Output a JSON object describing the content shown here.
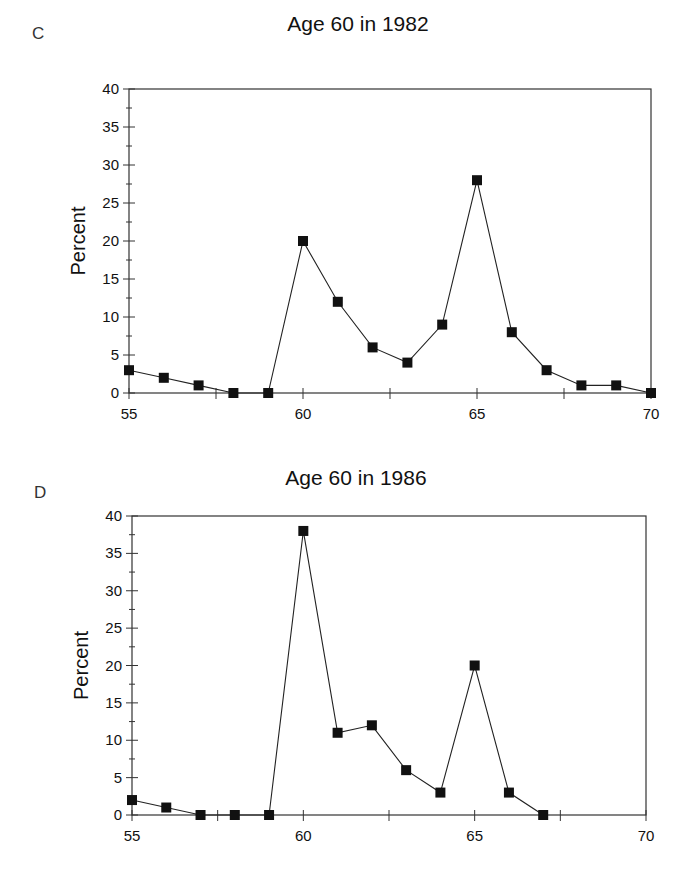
{
  "chart_data": [
    {
      "panel": "C",
      "type": "line",
      "title": "Age 60 in 1982",
      "xlabel": "",
      "ylabel": "Percent",
      "x": [
        55,
        56,
        57,
        58,
        59,
        60,
        61,
        62,
        63,
        64,
        65,
        66,
        67,
        68,
        69,
        70
      ],
      "series": [
        {
          "name": "Age 60 in 1982",
          "values": [
            3,
            2,
            1,
            0,
            0,
            20,
            12,
            6,
            4,
            9,
            28,
            8,
            3,
            1,
            1,
            0
          ]
        }
      ],
      "xlim": [
        55,
        70
      ],
      "ylim": [
        0,
        40
      ],
      "xticks": [
        55,
        60,
        65,
        70
      ],
      "yticks": [
        0,
        5,
        10,
        15,
        20,
        25,
        30,
        35,
        40
      ],
      "marker": "square",
      "grid": false,
      "legend": "none"
    },
    {
      "panel": "D",
      "type": "line",
      "title": "Age 60 in 1986",
      "xlabel": "",
      "ylabel": "Percent",
      "x": [
        55,
        56,
        57,
        58,
        59,
        60,
        61,
        62,
        63,
        64,
        65,
        66,
        67
      ],
      "series": [
        {
          "name": "Age 60 in 1986",
          "values": [
            2,
            1,
            0,
            0,
            0,
            38,
            11,
            12,
            6,
            3,
            20,
            3,
            0
          ]
        }
      ],
      "xlim": [
        55,
        70
      ],
      "ylim": [
        0,
        40
      ],
      "xticks": [
        55,
        60,
        65,
        70
      ],
      "yticks": [
        0,
        5,
        10,
        15,
        20,
        25,
        30,
        35,
        40
      ],
      "marker": "square",
      "grid": false,
      "legend": "none"
    }
  ],
  "panels": {
    "c": {
      "label": "C",
      "title": "Age 60 in 1982",
      "ylabel": "Percent"
    },
    "d": {
      "label": "D",
      "title": "Age 60 in 1986",
      "ylabel": "Percent"
    }
  },
  "colors": {
    "line": "#222222",
    "marker": "#111111",
    "axis": "#333333"
  }
}
